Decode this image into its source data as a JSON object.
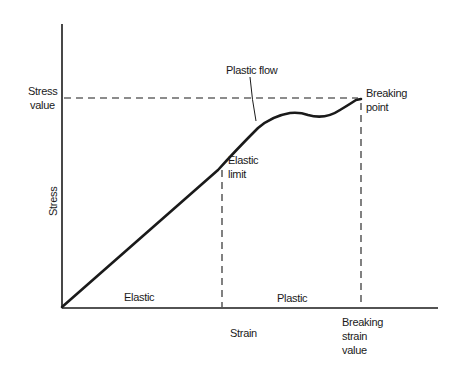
{
  "diagram": {
    "y_axis_label": "Stress",
    "x_axis_label": "Strain",
    "stress_value_label": [
      "Stress",
      "value"
    ],
    "elastic_limit_label": [
      "Elastic",
      "limit"
    ],
    "plastic_flow_label": "Plastic flow",
    "breaking_point_label": [
      "Breaking",
      "point"
    ],
    "breaking_strain_label": [
      "Breaking",
      "strain",
      "value"
    ],
    "region_elastic_label": "Elastic",
    "region_plastic_label": "Plastic"
  },
  "colors": {
    "ink": "#1a1a1a",
    "background": "#ffffff"
  }
}
